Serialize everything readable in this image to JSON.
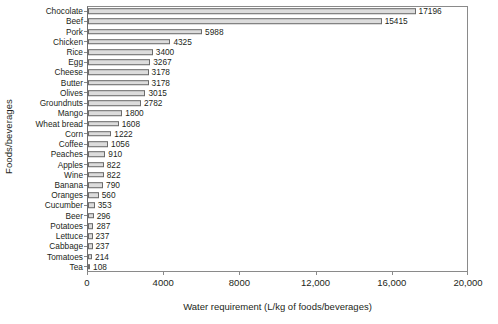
{
  "chart_data": {
    "type": "bar",
    "orientation": "horizontal",
    "title": "",
    "xlabel": "Water requirement (L/kg of foods/beverages)",
    "ylabel": "Foods/beverages",
    "xlim": [
      0,
      20000
    ],
    "xticks": [
      0,
      4000,
      8000,
      12000,
      16000,
      20000
    ],
    "xtick_labels": [
      "0",
      "4000",
      "8000",
      "12,000",
      "16,000",
      "20,000"
    ],
    "grid": false,
    "legend": false,
    "bar_fill_color": "#dcdcdc",
    "bar_edge_color": "#6b6b6b",
    "categories": [
      "Chocolate",
      "Beef",
      "Pork",
      "Chicken",
      "Rice",
      "Egg",
      "Cheese",
      "Butter",
      "Olives",
      "Groundnuts",
      "Mango",
      "Wheat bread",
      "Corn",
      "Coffee",
      "Peaches",
      "Apples",
      "Wine",
      "Banana",
      "Oranges",
      "Cucumber",
      "Beer",
      "Potatoes",
      "Lettuce",
      "Cabbage",
      "Tomatoes",
      "Tea"
    ],
    "values": [
      17196,
      15415,
      5988,
      4325,
      3400,
      3267,
      3178,
      3178,
      3015,
      2782,
      1800,
      1608,
      1222,
      1056,
      910,
      822,
      822,
      790,
      560,
      353,
      296,
      287,
      237,
      237,
      214,
      108
    ],
    "value_labels": [
      "17196",
      "15415",
      "5988",
      "4325",
      "3400",
      "3267",
      "3178",
      "3178",
      "3015",
      "2782",
      "1800",
      "1608",
      "1222",
      "1056",
      "910",
      "822",
      "822",
      "790",
      "560",
      "353",
      "296",
      "287",
      "237",
      "237",
      "214",
      "108"
    ]
  }
}
